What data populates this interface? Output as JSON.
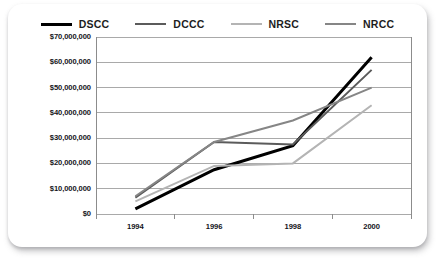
{
  "chart_data": {
    "type": "line",
    "title": "",
    "xlabel": "",
    "ylabel": "",
    "categories": [
      "1994",
      "1996",
      "1998",
      "2000"
    ],
    "x": [
      1994,
      1996,
      1998,
      2000
    ],
    "series": [
      {
        "name": "DSCC",
        "color": "#000000",
        "width": 3.0,
        "values": [
          2000000,
          17500000,
          27000000,
          62000000
        ]
      },
      {
        "name": "DCCC",
        "color": "#5b5b5b",
        "width": 2.0,
        "values": [
          6500000,
          28500000,
          27500000,
          57000000
        ]
      },
      {
        "name": "NRSC",
        "color": "#b4b4b4",
        "width": 2.0,
        "values": [
          5000000,
          19000000,
          20000000,
          43000000
        ]
      },
      {
        "name": "NRCC",
        "color": "#868686",
        "width": 2.0,
        "values": [
          7000000,
          28500000,
          37000000,
          50000000
        ]
      }
    ],
    "ylim": [
      0,
      70000000
    ],
    "yticks": [
      0,
      10000000,
      20000000,
      30000000,
      40000000,
      50000000,
      60000000,
      70000000
    ],
    "ytick_labels": [
      "$0",
      "$10,000,000",
      "$20,000,000",
      "$30,000,000",
      "$40,000,000",
      "$50,000,000",
      "$60,000,000",
      "$70,000,000"
    ],
    "grid": "horizontal",
    "legend_position": "top",
    "plot_background": "#ffffff",
    "gridline_color": "#a9a9a9",
    "axis_color": "#8c8c8c"
  },
  "card": {
    "background": "#ffffff"
  }
}
